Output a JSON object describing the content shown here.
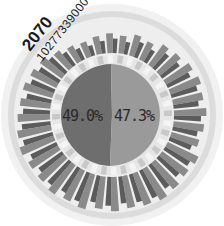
{
  "chart_data": {
    "type": "radial-bar-with-pie",
    "title": "",
    "year_label": "2070",
    "total_label": "10277339000",
    "center_pie": {
      "slices": [
        {
          "name": "left",
          "value": 49.0,
          "label": "49.0%",
          "color": "#6e6e6e"
        },
        {
          "name": "right",
          "value": 47.3,
          "label": "47.3%",
          "color": "#9a9a9a"
        }
      ]
    },
    "radial_bars": {
      "count": 36,
      "colors": [
        "#5c5c5c",
        "#8a8a8a",
        "#b5b5b5"
      ],
      "values_outer": [
        0.55,
        0.5,
        0.6,
        0.55,
        0.7,
        0.75,
        0.85,
        0.9,
        0.85,
        0.9,
        0.85,
        0.8,
        0.95,
        0.9,
        0.95,
        1.0,
        0.95,
        0.9,
        0.95,
        0.9,
        1.0,
        0.95,
        1.0,
        0.95,
        0.95,
        1.0,
        0.95,
        0.9,
        0.85,
        0.85,
        0.8,
        0.75,
        0.6,
        0.5,
        0.45,
        0.5
      ],
      "values_mid": [
        0.4,
        0.35,
        0.45,
        0.4,
        0.55,
        0.6,
        0.7,
        0.75,
        0.7,
        0.75,
        0.7,
        0.65,
        0.8,
        0.75,
        0.8,
        0.85,
        0.8,
        0.75,
        0.8,
        0.75,
        0.85,
        0.8,
        0.85,
        0.8,
        0.8,
        0.85,
        0.8,
        0.75,
        0.7,
        0.7,
        0.65,
        0.6,
        0.45,
        0.35,
        0.3,
        0.35
      ]
    },
    "rings": {
      "outer_ring_color": "#d6d6d6",
      "outer_halo_color": "#ececec",
      "inner_ring_color": "#e4e4e4"
    }
  },
  "labels": {
    "year": "2070",
    "total": "10277339000",
    "left_pct": "49.0%",
    "right_pct": "47.3%"
  }
}
